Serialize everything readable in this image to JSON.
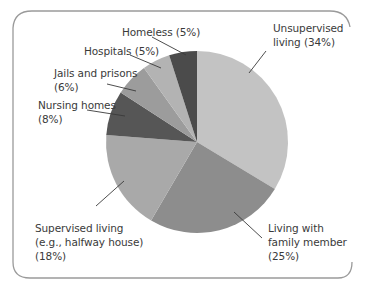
{
  "chart_data": {
    "type": "pie",
    "title": "",
    "start_angle_deg": 0,
    "direction": "clockwise",
    "center": [
      197,
      142
    ],
    "radius": 91,
    "slices": [
      {
        "label": "Unsupervised living",
        "value": 34,
        "color": "#c3c3c3"
      },
      {
        "label": "Living with family member",
        "value": 25,
        "color": "#8d8d8d"
      },
      {
        "label": "Supervised living (e.g., halfway house)",
        "value": 18,
        "color": "#a9a9a9"
      },
      {
        "label": "Nursing homes",
        "value": 8,
        "color": "#565656"
      },
      {
        "label": "Jails and prisons",
        "value": 6,
        "color": "#9c9c9c"
      },
      {
        "label": "Hospitals",
        "value": 5,
        "color": "#b3b3b3"
      },
      {
        "label": "Homeless",
        "value": 5,
        "color": "#4b4b4b"
      }
    ]
  },
  "labels": {
    "unsupervised": {
      "line1": "Unsupervised",
      "line2": "living (34%)"
    },
    "family": {
      "line1": "Living with",
      "line2": "family member",
      "line3": "(25%)"
    },
    "supervised": {
      "line1": "Supervised living",
      "line2": "(e.g., halfway house)",
      "line3": "(18%)"
    },
    "nursing": {
      "line1": "Nursing homes",
      "line2": "(8%)"
    },
    "jails": {
      "line1": "Jails and prisons",
      "line2": "(6%)"
    },
    "hospitals": {
      "line1": "Hospitals (5%)"
    },
    "homeless": {
      "line1": "Homeless (5%)"
    }
  },
  "colors": {
    "frame": "#9a9a9a",
    "leader": "#3a3a3a"
  }
}
